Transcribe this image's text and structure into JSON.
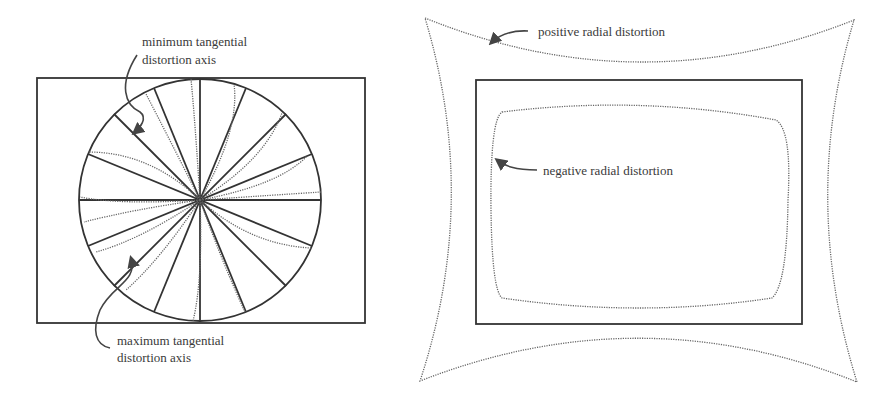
{
  "figure_left": {
    "title": "tangential distortion",
    "labels": {
      "min_line1": "minimum tangential",
      "min_line2": "distortion axis",
      "max_line1": "maximum tangential",
      "max_line2": "distortion axis"
    },
    "rect": {
      "x": 37,
      "y": 78,
      "w": 328,
      "h": 245
    },
    "circle": {
      "cx": 200,
      "cy": 200,
      "r": 121
    },
    "spoke_count": 16
  },
  "figure_right": {
    "title": "radial distortion",
    "labels": {
      "positive": "positive radial distortion",
      "negative": "negative radial distortion"
    },
    "rect": {
      "x": 476,
      "y": 80,
      "w": 326,
      "h": 244
    }
  },
  "colors": {
    "line": "#333333",
    "dotted": "#666666",
    "text": "#3a3a3a",
    "background": "#ffffff"
  }
}
